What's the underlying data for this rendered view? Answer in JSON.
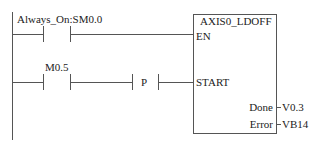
{
  "rungs": [
    {
      "contact": {
        "label": "Always_On:SM0.0",
        "type": "normally-open"
      }
    },
    {
      "contact": {
        "label": "M0.5",
        "type": "normally-open"
      },
      "edge": {
        "label": "P",
        "type": "positive-transition"
      }
    }
  ],
  "block": {
    "title": "AXIS0_LDOFF",
    "inputs": [
      {
        "name": "EN"
      },
      {
        "name": "START"
      }
    ],
    "outputs": [
      {
        "name": "Done",
        "value": "V0.3"
      },
      {
        "name": "Error",
        "value": "VB14"
      }
    ]
  },
  "colors": {
    "line": "#555555",
    "text": "#222222",
    "background": "#ffffff"
  }
}
